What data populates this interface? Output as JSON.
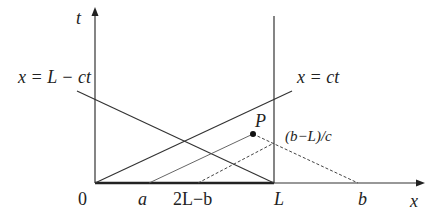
{
  "diagram": {
    "type": "characteristics-diagram",
    "axes": {
      "x_label": "x",
      "t_label": "t",
      "origin_label": "0"
    },
    "lines": {
      "left_characteristic": "x = L − ct",
      "right_characteristic": "x = ct"
    },
    "points": {
      "p_label": "P",
      "reflection_label": "(b−L)/c"
    },
    "x_ticks": {
      "a": "a",
      "mirror": "2L−b",
      "L": "L",
      "b": "b"
    },
    "colors": {
      "ink": "#222222",
      "thin": "#444444"
    }
  }
}
